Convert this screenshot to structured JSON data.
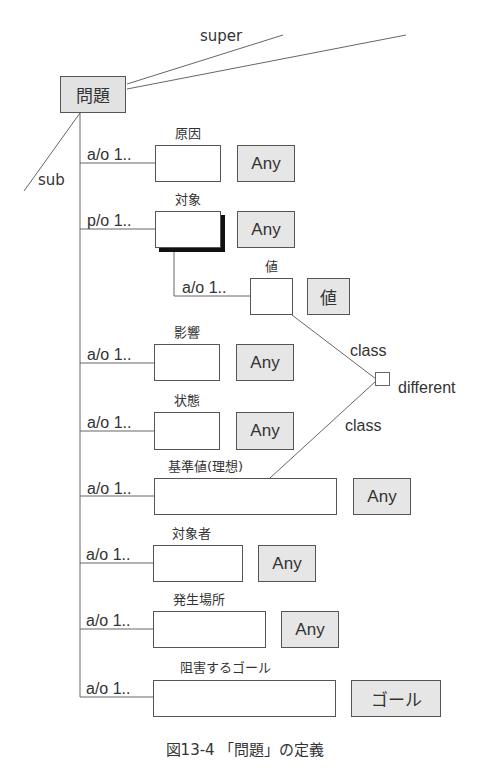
{
  "root": {
    "label": "問題"
  },
  "inheritance": {
    "super_label": "super",
    "sub_label": "sub"
  },
  "slots": [
    {
      "name": "原因",
      "relation": "a/o 1..",
      "type": "Any"
    },
    {
      "name": "対象",
      "relation": "p/o 1..",
      "type": "Any",
      "highlighted": true
    },
    {
      "name": "値",
      "relation": "a/o 1..",
      "type": "値",
      "nested_under": "対象"
    },
    {
      "name": "影響",
      "relation": "a/o 1..",
      "type": "Any"
    },
    {
      "name": "状態",
      "relation": "a/o 1..",
      "type": "Any"
    },
    {
      "name": "基準値(理想)",
      "relation": "a/o 1..",
      "type": "Any"
    },
    {
      "name": "対象者",
      "relation": "a/o 1..",
      "type": "Any"
    },
    {
      "name": "発生場所",
      "relation": "a/o 1..",
      "type": "Any"
    },
    {
      "name": "阻害するゴール",
      "relation": "a/o 1..",
      "type": "ゴール"
    }
  ],
  "constraint": {
    "label": "different",
    "edge_labels": [
      "class",
      "class"
    ]
  },
  "caption": "図13-4 「問題」の定義",
  "colors": {
    "type_fill": "#e6e6e6",
    "line": "#555555",
    "text": "#333333"
  }
}
